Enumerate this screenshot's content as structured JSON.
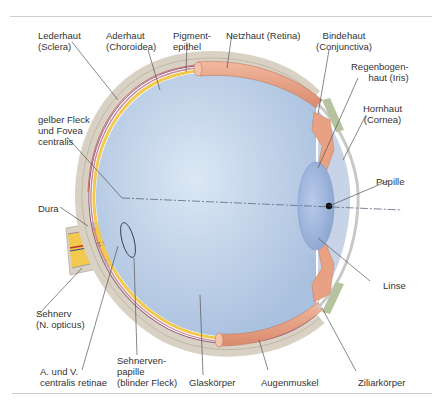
{
  "diagram": {
    "type": "anatomical-cross-section",
    "colors": {
      "sclera": "#d9d2c4",
      "choroid": "#c98a9c",
      "retina_yellow": "#f2c94c",
      "vitreous": "#b8cde6",
      "lens": "#9fb6dd",
      "iris_muscle": "#e8a283",
      "conjunctiva": "#b7c2a0",
      "optic_nerve": "#f0c23a",
      "pupil": "#111111",
      "axis_line": "#5a6a80",
      "leader_line": "#555555",
      "rule": "#cfcfcf"
    },
    "labels": {
      "lederhaut": [
        "Lederhaut",
        "(Sclera)"
      ],
      "aderhaut": [
        "Aderhaut",
        "(Choroidea)"
      ],
      "pigmentepithel": [
        "Pigment-",
        "epithel"
      ],
      "netzhaut": [
        "Netzhaut (Retina)"
      ],
      "bindehaut": [
        "Bindehaut",
        "(Conjunctiva)"
      ],
      "regenbogenhaut": [
        "Regenbogen-",
        "haut (Iris)"
      ],
      "hornhaut": [
        "Hornhaut",
        "(Cornea)"
      ],
      "gelber_fleck": [
        "gelber Fleck",
        "und Fovea",
        "centralis"
      ],
      "pupille": [
        "Pupille"
      ],
      "dura": [
        "Dura"
      ],
      "linse": [
        "Linse"
      ],
      "sehnerv": [
        "Sehnerv",
        "(N. opticus)"
      ],
      "centralis": [
        "A. und V.",
        "centralis retinae"
      ],
      "sehnervenpapille": [
        "Sehnerven-",
        "papille",
        "(blinder Fleck)"
      ],
      "glaskoerper": [
        "Glaskörper"
      ],
      "augenmuskel": [
        "Augenmuskel"
      ],
      "ziliarkoerper": [
        "Ziliarkörper"
      ]
    }
  }
}
